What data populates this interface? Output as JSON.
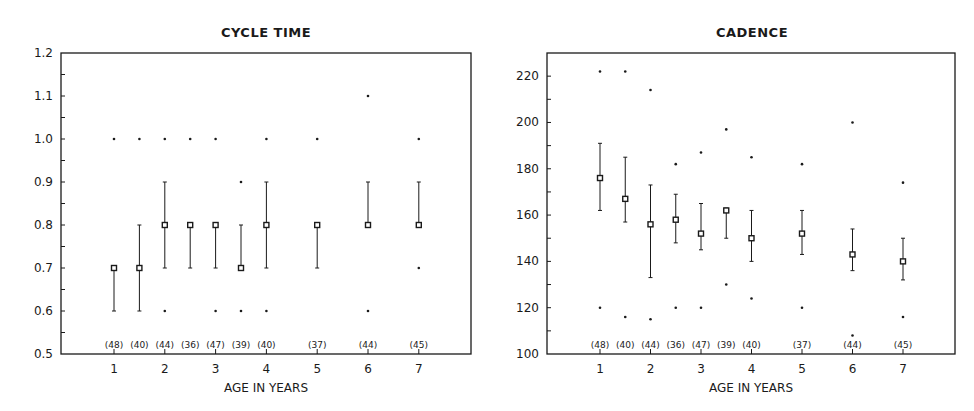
{
  "chart_data": [
    {
      "type": "scatter",
      "subtype": "median-with-range-and-extremes",
      "title": "CYCLE TIME",
      "xlabel": "AGE IN YEARS",
      "ylabel": "",
      "ylim": [
        0.5,
        1.2
      ],
      "yticks": [
        "0.5",
        "0.6",
        "0.7",
        "0.8",
        "0.9",
        "1.0",
        "1.1",
        "1.2"
      ],
      "xticks": [
        "1",
        "2",
        "3",
        "4",
        "5",
        "6",
        "7"
      ],
      "xlim": [
        0,
        8
      ],
      "grid": false,
      "legend": null,
      "groups": [
        {
          "age": 1,
          "n": "(48)",
          "median": 0.7,
          "low": 0.6,
          "high": 0.7,
          "min": null,
          "max": 1.0
        },
        {
          "age": 1.5,
          "n": "(40)",
          "median": 0.7,
          "low": 0.6,
          "high": 0.8,
          "min": null,
          "max": 1.0
        },
        {
          "age": 2,
          "n": "(44)",
          "median": 0.8,
          "low": 0.7,
          "high": 0.9,
          "min": 0.6,
          "max": 1.0
        },
        {
          "age": 2.5,
          "n": "(36)",
          "median": 0.8,
          "low": 0.7,
          "high": 0.8,
          "min": null,
          "max": 1.0
        },
        {
          "age": 3,
          "n": "(47)",
          "median": 0.8,
          "low": 0.7,
          "high": 0.8,
          "min": 0.6,
          "max": 1.0
        },
        {
          "age": 3.5,
          "n": "(39)",
          "median": 0.7,
          "low": 0.7,
          "high": 0.8,
          "min": 0.6,
          "max": 0.9
        },
        {
          "age": 4,
          "n": "(40)",
          "median": 0.8,
          "low": 0.7,
          "high": 0.9,
          "min": 0.6,
          "max": 1.0
        },
        {
          "age": 5,
          "n": "(37)",
          "median": 0.8,
          "low": 0.7,
          "high": 0.8,
          "min": null,
          "max": 1.0
        },
        {
          "age": 6,
          "n": "(44)",
          "median": 0.8,
          "low": 0.8,
          "high": 0.9,
          "min": 0.6,
          "max": 1.1
        },
        {
          "age": 7,
          "n": "(45)",
          "median": 0.8,
          "low": 0.8,
          "high": 0.9,
          "min": 0.7,
          "max": 1.0
        }
      ]
    },
    {
      "type": "scatter",
      "subtype": "median-with-range-and-extremes",
      "title": "CADENCE",
      "xlabel": "AGE IN YEARS",
      "ylabel": "",
      "ylim": [
        100,
        230
      ],
      "yticks": [
        "100",
        "120",
        "140",
        "160",
        "180",
        "200",
        "220"
      ],
      "xticks": [
        "1",
        "2",
        "3",
        "4",
        "5",
        "6",
        "7"
      ],
      "xlim": [
        0,
        8
      ],
      "grid": false,
      "legend": null,
      "groups": [
        {
          "age": 1,
          "n": "(48)",
          "median": 176,
          "low": 162,
          "high": 191,
          "min": 120,
          "max": 222
        },
        {
          "age": 1.5,
          "n": "(40)",
          "median": 167,
          "low": 157,
          "high": 185,
          "min": 116,
          "max": 222
        },
        {
          "age": 2,
          "n": "(44)",
          "median": 156,
          "low": 133,
          "high": 173,
          "min": 115,
          "max": 214
        },
        {
          "age": 2.5,
          "n": "(36)",
          "median": 158,
          "low": 148,
          "high": 169,
          "min": 120,
          "max": 182
        },
        {
          "age": 3,
          "n": "(47)",
          "median": 152,
          "low": 145,
          "high": 165,
          "min": 120,
          "max": 187
        },
        {
          "age": 3.5,
          "n": "(39)",
          "median": 162,
          "low": 150,
          "high": 163,
          "min": 130,
          "max": 197
        },
        {
          "age": 4,
          "n": "(40)",
          "median": 150,
          "low": 140,
          "high": 162,
          "min": 124,
          "max": 185
        },
        {
          "age": 5,
          "n": "(37)",
          "median": 152,
          "low": 143,
          "high": 162,
          "min": 120,
          "max": 182
        },
        {
          "age": 6,
          "n": "(44)",
          "median": 143,
          "low": 136,
          "high": 154,
          "min": 108,
          "max": 200
        },
        {
          "age": 7,
          "n": "(45)",
          "median": 140,
          "low": 132,
          "high": 150,
          "min": 116,
          "max": 174
        }
      ]
    }
  ],
  "layout": [
    {
      "left": 61,
      "right": 471,
      "top": 53,
      "bottom": 354,
      "x1px": 114,
      "xstep": 50.8,
      "titleX": 266
    },
    {
      "left": 547,
      "right": 955,
      "top": 53,
      "bottom": 354,
      "x1px": 600,
      "xstep": 50.5,
      "titleX": 752
    }
  ],
  "colors": {
    "ink": "#1a1a1a",
    "background": "#ffffff"
  }
}
